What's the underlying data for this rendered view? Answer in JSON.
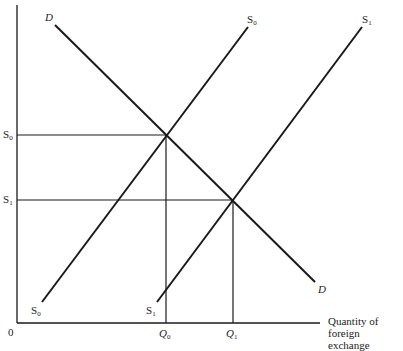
{
  "diagram": {
    "type": "supply-demand",
    "title": "",
    "colors": {
      "line": "#1a1a1a",
      "text": "#222222",
      "background": "#ffffff"
    },
    "axes": {
      "origin_label": "0",
      "x_label_line1": "Quantity of",
      "x_label_line2": "foreign exchange",
      "y_label": ""
    },
    "curves": [
      {
        "id": "D",
        "label_start": "D",
        "label_end": "D",
        "kind": "demand",
        "from": [
          55,
          25
        ],
        "to": [
          315,
          282
        ]
      },
      {
        "id": "S0",
        "label_base": "S",
        "label_sub": "0",
        "kind": "supply",
        "from": [
          42,
          302
        ],
        "to": [
          248,
          27
        ]
      },
      {
        "id": "S1",
        "label_base": "S",
        "label_sub": "1",
        "kind": "supply",
        "from": [
          157,
          302
        ],
        "to": [
          362,
          27
        ]
      }
    ],
    "equilibria": [
      {
        "name": "E0",
        "price_label_base": "S",
        "price_label_sub": "0",
        "qty_label_base": "Q",
        "qty_label_sub": "0",
        "point": [
          166,
          135
        ]
      },
      {
        "name": "E1",
        "price_label_base": "S",
        "price_label_sub": "1",
        "qty_label_base": "Q",
        "qty_label_sub": "1",
        "point": [
          233,
          200
        ]
      }
    ],
    "labels": {
      "D_top": "D",
      "D_bottom": "D",
      "S0_top_base": "S",
      "S0_top_sub": "0",
      "S1_top_base": "S",
      "S1_top_sub": "1",
      "S0_bottom_base": "S",
      "S0_bottom_sub": "0",
      "S1_bottom_base": "S",
      "S1_bottom_sub": "1",
      "y_S0_base": "S",
      "y_S0_sub": "0",
      "y_S1_base": "S",
      "y_S1_sub": "1",
      "Q0_base": "Q",
      "Q0_sub": "0",
      "Q1_base": "Q",
      "Q1_sub": "1"
    }
  }
}
